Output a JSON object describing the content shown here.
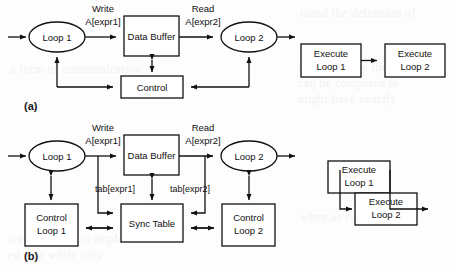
{
  "figure": {
    "panels": [
      {
        "id": "a",
        "label": "(a)",
        "nodes": {
          "loop1": "Loop 1",
          "data_buffer": "Data Buffer",
          "loop2": "Loop 2",
          "control": "Control"
        },
        "edge_labels": {
          "write": "Write",
          "write_expr": "A[expr1]",
          "read": "Read",
          "read_expr": "A[expr2]"
        },
        "timeline": {
          "box1_line1": "Execute",
          "box1_line2": "Loop 1",
          "box2_line1": "Execute",
          "box2_line2": "Loop 2"
        }
      },
      {
        "id": "b",
        "label": "(b)",
        "nodes": {
          "loop1": "Loop 1",
          "data_buffer": "Data Buffer",
          "loop2": "Loop 2",
          "sync_table": "Sync Table",
          "control1_line1": "Control",
          "control1_line2": "Loop 1",
          "control2_line1": "Control",
          "control2_line2": "Loop 2"
        },
        "edge_labels": {
          "write": "Write",
          "write_expr": "A[expr1]",
          "read": "Read",
          "read_expr": "A[expr2]",
          "tab1": "tab[expr1]",
          "tab2": "tab[expr2]"
        },
        "timeline": {
          "box1_line1": "Execute",
          "box1_line2": "Loop 1",
          "box2_line1": "Execute",
          "box2_line2": "Loop 2"
        }
      }
    ]
  },
  "background_text": {
    "line1": "mand the definition of",
    "line2": "there because the ends",
    "line3": "can be computed to",
    "line4": "might have exactly",
    "line5": "a form of communication",
    "line6": "are necessary to implement",
    "line7": "ed side while only",
    "line8": "when as compared to"
  },
  "colors": {
    "stroke": "#111111",
    "background": "#fdfdfd",
    "text": "#1a1a1a"
  }
}
